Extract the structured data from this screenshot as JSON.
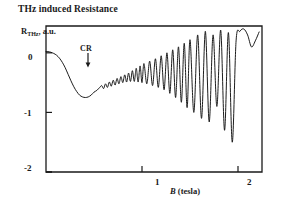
{
  "title": "THz induced Resistance",
  "annotation": {
    "label": "CR"
  },
  "colors": {
    "axis": "#1a1a1a",
    "curve": "#111111",
    "background": "#ffffff"
  },
  "chart_data": {
    "type": "line",
    "title": "THz induced Resistance",
    "xlabel": "B (tesla)",
    "xlabel_italic_part": "B",
    "xlabel_rest": " (tesla)",
    "ylabel": "R",
    "ylabel_sub": "THz",
    "ylabel_units": ", a.u.",
    "xlim": [
      0.0,
      2.25
    ],
    "ylim": [
      -2.0,
      0.45
    ],
    "xticks": [
      1,
      2
    ],
    "xticklabels": [
      "1",
      "2"
    ],
    "yticks": [
      0,
      -1,
      -2
    ],
    "yticklabels": [
      "0",
      "-1",
      "-2"
    ],
    "grid": false,
    "legend": null,
    "annotations": [
      {
        "text": "CR",
        "x": 0.43,
        "y": 0.3,
        "arrow": "down",
        "arrow_tip_y": 0.02
      }
    ],
    "series": [
      {
        "name": "THz induced magnetoresistance",
        "description": "Broad cyclotron-resonance dip near B=0.48 T followed by magneto-oscillations of growing amplitude and period",
        "x": [
          0.0,
          0.02,
          0.05,
          0.08,
          0.11,
          0.14,
          0.17,
          0.2,
          0.23,
          0.26,
          0.29,
          0.32,
          0.35,
          0.38,
          0.41,
          0.44,
          0.47,
          0.5,
          0.53,
          0.56,
          0.58,
          0.6,
          0.62,
          0.64,
          0.66,
          0.68,
          0.7,
          0.72,
          0.74,
          0.76,
          0.78,
          0.8,
          0.82,
          0.84,
          0.86,
          0.88,
          0.9,
          0.92,
          0.94,
          0.96,
          0.98,
          1.0,
          1.02,
          1.05,
          1.08,
          1.11,
          1.14,
          1.17,
          1.2,
          1.23,
          1.26,
          1.29,
          1.32,
          1.35,
          1.38,
          1.41,
          1.44,
          1.47,
          1.5,
          1.54,
          1.58,
          1.62,
          1.66,
          1.7,
          1.74,
          1.78,
          1.82,
          1.86,
          1.9,
          1.94,
          1.98,
          2.02,
          2.06,
          2.1,
          2.14,
          2.18,
          2.22
        ],
        "y": [
          0.02,
          0.02,
          0.01,
          -0.01,
          -0.04,
          -0.09,
          -0.16,
          -0.25,
          -0.36,
          -0.47,
          -0.57,
          -0.65,
          -0.71,
          -0.74,
          -0.75,
          -0.74,
          -0.71,
          -0.66,
          -0.63,
          -0.58,
          -0.55,
          -0.6,
          -0.52,
          -0.58,
          -0.49,
          -0.56,
          -0.46,
          -0.54,
          -0.43,
          -0.52,
          -0.4,
          -0.5,
          -0.37,
          -0.49,
          -0.34,
          -0.48,
          -0.3,
          -0.48,
          -0.26,
          -0.49,
          -0.22,
          -0.5,
          -0.18,
          -0.52,
          -0.14,
          -0.55,
          -0.1,
          -0.58,
          -0.05,
          -0.62,
          0.0,
          -0.68,
          0.05,
          -0.75,
          0.1,
          -0.83,
          0.16,
          -0.92,
          0.22,
          -1.0,
          0.3,
          -1.1,
          0.36,
          -1.16,
          0.3,
          -0.9,
          0.38,
          -1.3,
          0.34,
          -1.5,
          0.2,
          0.36,
          0.4,
          0.3,
          0.1,
          0.2,
          0.35
        ]
      }
    ]
  },
  "axes_geometry": {
    "plot_left_px": 46,
    "plot_right_px": 262,
    "plot_top_px": 26,
    "plot_bottom_px": 172
  }
}
